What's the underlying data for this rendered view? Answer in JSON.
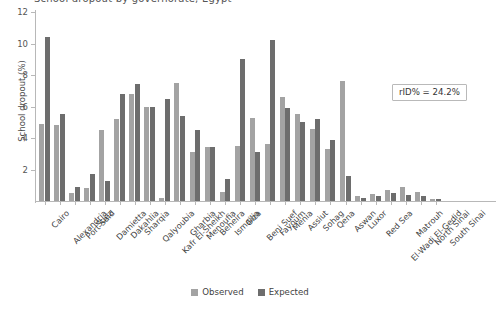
{
  "chart_data": {
    "type": "bar",
    "title": "School dropout by governorate, Egypt",
    "xlabel": "",
    "ylabel": "School dropout (%)",
    "ylim": [
      0,
      12
    ],
    "yticks": [
      "0",
      "2",
      "4",
      "6",
      "8",
      "10",
      "12"
    ],
    "grid": false,
    "legend_position": "bottom",
    "annotation": "rID% = 24.2%",
    "colors": {
      "observed": "#a3a3a3",
      "expected": "#6d6d6d",
      "axis": "#b8b8b8",
      "text": "#3f3f3f"
    },
    "categories": [
      "Cairo",
      "Alexandria",
      "Port Said",
      "Suez",
      "Damietta",
      "Dakahlia",
      "Sharqia",
      "Qalyoubia",
      "Kafr El-Sheikh",
      "Gharbia",
      "Menoufia",
      "Beheira",
      "Ismailia",
      "Giza",
      "Beni Suef",
      "Fayoum",
      "Menia",
      "Assiut",
      "Sohag",
      "Qena",
      "Aswan",
      "Luxor",
      "Red Sea",
      "El-Wadi El-Gedid",
      "Matrouh",
      "North Sinai",
      "South Sinai"
    ],
    "series": [
      {
        "name": "Observed",
        "color": "#a3a3a3",
        "values": [
          4.9,
          4.8,
          0.5,
          0.8,
          4.5,
          5.2,
          6.8,
          6.0,
          0.2,
          7.5,
          3.1,
          3.4,
          0.6,
          3.5,
          5.3,
          3.6,
          6.6,
          5.5,
          4.6,
          3.3,
          7.6,
          0.3,
          0.45,
          0.7,
          0.9,
          0.55,
          0.15
        ]
      },
      {
        "name": "Expected",
        "color": "#6d6d6d",
        "values": [
          10.4,
          5.5,
          0.9,
          1.7,
          1.3,
          6.8,
          7.45,
          6.0,
          6.5,
          5.4,
          4.5,
          3.4,
          1.4,
          9.0,
          3.1,
          10.2,
          5.9,
          5.0,
          5.2,
          3.9,
          1.6,
          0.2,
          0.3,
          0.5,
          0.4,
          0.35,
          0.1
        ]
      }
    ]
  },
  "legend": {
    "items": [
      {
        "label": "Observed",
        "color": "#a3a3a3"
      },
      {
        "label": "Expected",
        "color": "#6d6d6d"
      }
    ]
  }
}
